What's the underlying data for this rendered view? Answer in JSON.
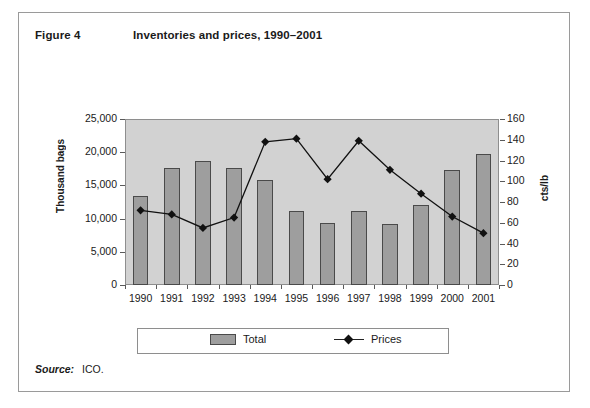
{
  "figure": {
    "number": "Figure 4",
    "title": "Inventories and prices, 1990–2001"
  },
  "source": {
    "label": "Source:",
    "text": "ICO."
  },
  "legend": {
    "total_label": "Total",
    "prices_label": "Prices",
    "total_color": "#9e9e9e",
    "prices_color": "#111111"
  },
  "chart_data": {
    "type": "bar",
    "title": "Inventories and prices, 1990–2001",
    "xlabel": "",
    "ylabel": "Thousand bags",
    "y2label": "cts/lb",
    "categories": [
      "1990",
      "1991",
      "1992",
      "1993",
      "1994",
      "1995",
      "1996",
      "1997",
      "1998",
      "1999",
      "2000",
      "2001"
    ],
    "ylim": [
      0,
      25000
    ],
    "y2lim": [
      0,
      160
    ],
    "yticks": [
      "0",
      "5,000",
      "10,000",
      "15,000",
      "20,000",
      "25,000"
    ],
    "y2ticks": [
      "0",
      "20",
      "40",
      "60",
      "80",
      "100",
      "120",
      "140",
      "160"
    ],
    "grid": false,
    "legend_position": "bottom",
    "series": [
      {
        "name": "Total",
        "type": "bar",
        "axis": "left",
        "unit": "Thousand bags",
        "values": [
          13400,
          17600,
          18750,
          17600,
          15800,
          11200,
          9400,
          11100,
          9200,
          12000,
          17300,
          19700
        ]
      },
      {
        "name": "Prices",
        "type": "line",
        "axis": "right",
        "unit": "cts/lb",
        "values": [
          72,
          68,
          55,
          65,
          138,
          141,
          102,
          139,
          111,
          88,
          66,
          50
        ]
      }
    ]
  }
}
